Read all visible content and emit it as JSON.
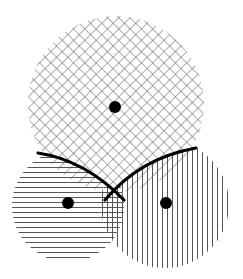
{
  "diagram": {
    "canvas": {
      "width": 243,
      "height": 279,
      "background": "#ffffff"
    },
    "colors": {
      "hatch": "#555555",
      "dot": "#000000",
      "boundary": "#000000"
    },
    "circles": [
      {
        "id": "top",
        "cx": 116,
        "cy": 104,
        "r": 88,
        "pattern": "crosshatch-diagonal",
        "dot": {
          "cx": 115,
          "cy": 107,
          "r": 6
        }
      },
      {
        "id": "left",
        "cx": 68,
        "cy": 206,
        "r": 56,
        "pattern": "horizontal",
        "dot": {
          "cx": 68,
          "cy": 203,
          "r": 6
        }
      },
      {
        "id": "right",
        "cx": 165,
        "cy": 204,
        "r": 64,
        "pattern": "vertical",
        "dot": {
          "cx": 166,
          "cy": 203,
          "r": 6
        }
      }
    ],
    "boundaries": [
      {
        "id": "left-arc",
        "path": "M38,153 Q85,160 124,200"
      },
      {
        "id": "right-arc",
        "path": "M105,200 Q140,158 196,148"
      }
    ]
  }
}
